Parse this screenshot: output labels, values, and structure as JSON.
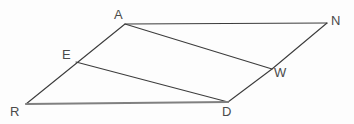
{
  "figure": {
    "kind": "geometry-diagram",
    "canvas": {
      "width": 354,
      "height": 124
    },
    "background_color": "#fdfdfd",
    "stroke_color": "#3c3c3c",
    "baseline_stroke_color": "#808080",
    "label_color": "#4a4a4a",
    "points": {
      "A": {
        "x": 125,
        "y": 24,
        "label": "A",
        "label_x": 114,
        "label_y": 8
      },
      "N": {
        "x": 327,
        "y": 23,
        "label": "N",
        "label_x": 331,
        "label_y": 14
      },
      "E": {
        "x": 76,
        "y": 62,
        "label": "E",
        "label_x": 62,
        "label_y": 48
      },
      "W": {
        "x": 272,
        "y": 69,
        "label": "W",
        "label_x": 274,
        "label_y": 66
      },
      "R": {
        "x": 26,
        "y": 104,
        "label": "R",
        "label_x": 10,
        "label_y": 105
      },
      "D": {
        "x": 228,
        "y": 102,
        "label": "D",
        "label_x": 222,
        "label_y": 105
      }
    },
    "segments": [
      {
        "name": "segment-R-A-N",
        "from": "R",
        "to": "N",
        "via": "A",
        "style": "thin-dark"
      },
      {
        "name": "segment-N-W-D",
        "from": "N",
        "to": "D",
        "via": "W",
        "style": "thin-dark"
      },
      {
        "name": "segment-A-W",
        "from": "A",
        "to": "W",
        "style": "thin-dark"
      },
      {
        "name": "segment-E-D",
        "from": "E",
        "to": "D",
        "style": "thin-dark"
      },
      {
        "name": "segment-R-D",
        "from": "R",
        "to": "D",
        "style": "thick-gray"
      }
    ]
  }
}
